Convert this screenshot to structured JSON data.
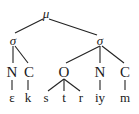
{
  "diagram": {
    "type": "syllable-tree",
    "root": {
      "id": "root",
      "label": "μ",
      "x": 46,
      "y": 13
    },
    "nodes": [
      {
        "id": "sigma1",
        "label": "σ",
        "x": 13,
        "y": 40,
        "cls": "greek"
      },
      {
        "id": "sigma2",
        "label": "σ",
        "x": 100,
        "y": 40,
        "cls": "greek"
      },
      {
        "id": "n1",
        "label": "N",
        "x": 12,
        "y": 72,
        "cls": "big"
      },
      {
        "id": "c1",
        "label": "C",
        "x": 29,
        "y": 72,
        "cls": "big"
      },
      {
        "id": "o2",
        "label": "O",
        "x": 64,
        "y": 72,
        "cls": "big"
      },
      {
        "id": "n2",
        "label": "N",
        "x": 100,
        "y": 72,
        "cls": "big"
      },
      {
        "id": "c2",
        "label": "C",
        "x": 125,
        "y": 72,
        "cls": "big"
      },
      {
        "id": "seg-e",
        "label": "ɛ",
        "x": 12,
        "y": 97,
        "cls": "small"
      },
      {
        "id": "seg-k",
        "label": "k",
        "x": 28,
        "y": 97,
        "cls": "small"
      },
      {
        "id": "seg-s",
        "label": "s",
        "x": 46,
        "y": 97,
        "cls": "small"
      },
      {
        "id": "seg-t",
        "label": "t",
        "x": 64,
        "y": 97,
        "cls": "small"
      },
      {
        "id": "seg-r",
        "label": "r",
        "x": 81,
        "y": 97,
        "cls": "small"
      },
      {
        "id": "seg-iy",
        "label": "iy",
        "x": 100,
        "y": 97,
        "cls": "small"
      },
      {
        "id": "seg-m",
        "label": "m",
        "x": 125,
        "y": 97,
        "cls": "small"
      }
    ],
    "edges": [
      {
        "from": [
          43,
          19
        ],
        "to": [
          15,
          33
        ]
      },
      {
        "from": [
          49,
          19
        ],
        "to": [
          97,
          35
        ]
      },
      {
        "from": [
          13,
          46
        ],
        "to": [
          13,
          63
        ]
      },
      {
        "from": [
          15,
          46
        ],
        "to": [
          28,
          63
        ]
      },
      {
        "from": [
          100,
          46
        ],
        "to": [
          66,
          63
        ]
      },
      {
        "from": [
          100,
          46
        ],
        "to": [
          100,
          63
        ]
      },
      {
        "from": [
          102,
          46
        ],
        "to": [
          124,
          63
        ]
      },
      {
        "from": [
          12,
          80
        ],
        "to": [
          12,
          90
        ]
      },
      {
        "from": [
          28,
          80
        ],
        "to": [
          28,
          90
        ]
      },
      {
        "from": [
          64,
          79
        ],
        "to": [
          48,
          91
        ]
      },
      {
        "from": [
          64,
          79
        ],
        "to": [
          64,
          91
        ]
      },
      {
        "from": [
          64,
          79
        ],
        "to": [
          80,
          91
        ]
      },
      {
        "from": [
          100,
          80
        ],
        "to": [
          100,
          90
        ]
      },
      {
        "from": [
          125,
          80
        ],
        "to": [
          125,
          90
        ]
      }
    ],
    "line_color": "#222222"
  }
}
